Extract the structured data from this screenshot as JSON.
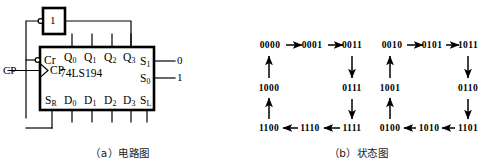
{
  "figure": {
    "panels": [
      {
        "id": "circuit",
        "caption": "（a）电路图"
      },
      {
        "id": "state",
        "caption": "（b）状态图"
      }
    ],
    "colors": {
      "ink": "#000000",
      "background": "#ffffff"
    }
  },
  "circuit": {
    "chip_name": "74LS194",
    "gate": {
      "label": "1"
    },
    "inputs": [
      {
        "name": "clock",
        "label": "CP"
      }
    ],
    "pins": {
      "left": [
        {
          "name": "Cr",
          "base": "Cr",
          "sub": ""
        },
        {
          "name": "CP",
          "base": "CP",
          "sub": ""
        }
      ],
      "top": [
        {
          "name": "Q0",
          "base": "Q",
          "sub": "0"
        },
        {
          "name": "Q1",
          "base": "Q",
          "sub": "1"
        },
        {
          "name": "Q2",
          "base": "Q",
          "sub": "2"
        },
        {
          "name": "Q3",
          "base": "Q",
          "sub": "3"
        }
      ],
      "right": [
        {
          "name": "S1",
          "base": "S",
          "sub": "1"
        },
        {
          "name": "S0",
          "base": "S",
          "sub": "0"
        }
      ],
      "bottom": [
        {
          "name": "SR",
          "base": "S",
          "sub": "R"
        },
        {
          "name": "D0",
          "base": "D",
          "sub": "0"
        },
        {
          "name": "D1",
          "base": "D",
          "sub": "1"
        },
        {
          "name": "D2",
          "base": "D",
          "sub": "2"
        },
        {
          "name": "D3",
          "base": "D",
          "sub": "3"
        },
        {
          "name": "SL",
          "base": "S",
          "sub": "L"
        }
      ]
    },
    "tie_values": [
      {
        "pin": "S1",
        "value": "0"
      },
      {
        "pin": "S0",
        "value": "1"
      }
    ]
  },
  "state_diagram": {
    "loops": [
      {
        "name": "left-loop",
        "nodes": [
          {
            "id": "L0",
            "label": "0000",
            "x": 30,
            "y": 45
          },
          {
            "id": "L1",
            "label": "0001",
            "x": 72,
            "y": 45
          },
          {
            "id": "L2",
            "label": "0011",
            "x": 112,
            "y": 45
          },
          {
            "id": "L3",
            "label": "0111",
            "x": 112,
            "y": 88
          },
          {
            "id": "L4",
            "label": "1111",
            "x": 112,
            "y": 128
          },
          {
            "id": "L5",
            "label": "1110",
            "x": 70,
            "y": 128
          },
          {
            "id": "L6",
            "label": "1100",
            "x": 29,
            "y": 128
          },
          {
            "id": "L7",
            "label": "1000",
            "x": 29,
            "y": 88
          }
        ],
        "transitions": [
          {
            "from": "L0",
            "to": "L1",
            "dir": "right"
          },
          {
            "from": "L1",
            "to": "L2",
            "dir": "right"
          },
          {
            "from": "L2",
            "to": "L3",
            "dir": "down"
          },
          {
            "from": "L3",
            "to": "L4",
            "dir": "down"
          },
          {
            "from": "L4",
            "to": "L5",
            "dir": "left"
          },
          {
            "from": "L5",
            "to": "L6",
            "dir": "left"
          },
          {
            "from": "L6",
            "to": "L7",
            "dir": "up"
          },
          {
            "from": "L7",
            "to": "L0",
            "dir": "up"
          }
        ]
      },
      {
        "name": "right-loop",
        "nodes": [
          {
            "id": "R0",
            "label": "0010",
            "x": 152,
            "y": 45
          },
          {
            "id": "R1",
            "label": "0101",
            "x": 192,
            "y": 45
          },
          {
            "id": "R2",
            "label": "1011",
            "x": 228,
            "y": 45
          },
          {
            "id": "R3",
            "label": "0110",
            "x": 228,
            "y": 88
          },
          {
            "id": "R4",
            "label": "1101",
            "x": 228,
            "y": 128
          },
          {
            "id": "R5",
            "label": "1010",
            "x": 189,
            "y": 128
          },
          {
            "id": "R6",
            "label": "0100",
            "x": 150,
            "y": 128
          },
          {
            "id": "R7",
            "label": "1001",
            "x": 150,
            "y": 88
          }
        ],
        "transitions": [
          {
            "from": "R0",
            "to": "R1",
            "dir": "right"
          },
          {
            "from": "R1",
            "to": "R2",
            "dir": "right"
          },
          {
            "from": "R2",
            "to": "R3",
            "dir": "down"
          },
          {
            "from": "R3",
            "to": "R4",
            "dir": "down"
          },
          {
            "from": "R4",
            "to": "R5",
            "dir": "left"
          },
          {
            "from": "R5",
            "to": "R6",
            "dir": "left"
          },
          {
            "from": "R6",
            "to": "R7",
            "dir": "up"
          },
          {
            "from": "R7",
            "to": "R0",
            "dir": "up"
          }
        ]
      }
    ]
  }
}
